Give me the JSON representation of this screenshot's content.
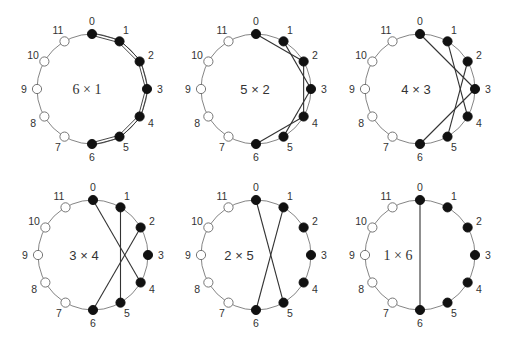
{
  "figure": {
    "node_count": 12,
    "radius": 55,
    "node_radius": 4.6,
    "label_offset": 13,
    "colors": {
      "circle": "#777777",
      "edge": "#333333",
      "filled_node": "#111111",
      "open_node_fill": "#ffffff",
      "open_node_stroke": "#666666",
      "text": "#333333"
    },
    "node_labels": [
      "0",
      "1",
      "2",
      "3",
      "4",
      "5",
      "6",
      "7",
      "8",
      "9",
      "10",
      "11"
    ],
    "filled_nodes": [
      0,
      1,
      2,
      3,
      4,
      5,
      6
    ],
    "open_nodes": [
      7,
      8,
      9,
      10,
      11
    ],
    "panels": [
      {
        "id": "6x1",
        "label": "6 × 1",
        "serif_label": true,
        "center": [
          92,
          89
        ],
        "label_pos": [
          87,
          94
        ],
        "double_edges": true,
        "edges": [
          [
            0,
            1
          ],
          [
            1,
            2
          ],
          [
            2,
            3
          ],
          [
            3,
            4
          ],
          [
            4,
            5
          ],
          [
            5,
            6
          ]
        ]
      },
      {
        "id": "5x2",
        "label": "5 × 2",
        "serif_label": false,
        "center": [
          256,
          89
        ],
        "label_pos": [
          255,
          94
        ],
        "double_edges": false,
        "edges": [
          [
            0,
            2
          ],
          [
            1,
            3
          ],
          [
            2,
            4
          ],
          [
            3,
            5
          ],
          [
            4,
            6
          ]
        ]
      },
      {
        "id": "4x3",
        "label": "4 × 3",
        "serif_label": false,
        "center": [
          420,
          89
        ],
        "label_pos": [
          416,
          94
        ],
        "double_edges": false,
        "edges": [
          [
            0,
            3
          ],
          [
            1,
            4
          ],
          [
            2,
            5
          ],
          [
            3,
            6
          ]
        ]
      },
      {
        "id": "3x4",
        "label": "3 × 4",
        "serif_label": false,
        "center": [
          93,
          255
        ],
        "label_pos": [
          84,
          260
        ],
        "double_edges": false,
        "edges": [
          [
            0,
            4
          ],
          [
            1,
            5
          ],
          [
            2,
            6
          ]
        ]
      },
      {
        "id": "2x5",
        "label": "2 × 5",
        "serif_label": false,
        "center": [
          256,
          255
        ],
        "label_pos": [
          239,
          260
        ],
        "double_edges": false,
        "edges": [
          [
            0,
            5
          ],
          [
            1,
            6
          ]
        ]
      },
      {
        "id": "1x6",
        "label": "1 × 6",
        "serif_label": true,
        "center": [
          420,
          255
        ],
        "label_pos": [
          398,
          260
        ],
        "double_edges": false,
        "edges": [
          [
            0,
            6
          ]
        ]
      }
    ]
  }
}
